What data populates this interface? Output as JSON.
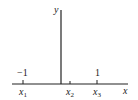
{
  "diagram": {
    "type": "number-line-axes",
    "axes": {
      "x_label": "x",
      "y_label": "y"
    },
    "ticks": [
      {
        "name": "x1",
        "symbol": "x",
        "subscript": "1",
        "value_label": "−1"
      },
      {
        "name": "x2",
        "symbol": "x",
        "subscript": "2",
        "value_label": ""
      },
      {
        "name": "x3",
        "symbol": "x",
        "subscript": "3",
        "value_label": "1"
      }
    ],
    "colors": {
      "axis": "#222222",
      "background": "#ffffff"
    }
  }
}
